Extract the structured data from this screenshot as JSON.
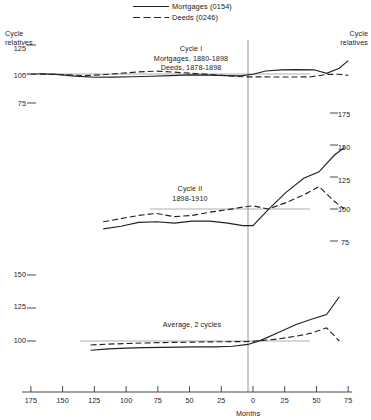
{
  "legend": {
    "position": "top-center",
    "entries": [
      {
        "label": "Mortgages (0154)",
        "style": "solid",
        "color": "#222222"
      },
      {
        "label": "Deeds (0246)",
        "style": "dashed",
        "color": "#222222"
      }
    ]
  },
  "axis_labels": {
    "left_top": "Cycle\nrelatives",
    "right_top": "Cycle\nrelatives",
    "xlabel": "Months"
  },
  "annotations": [
    {
      "name": "cycle-1-annotation",
      "text": "Cycle I\nMortgages, 1880-1898\nDeeds, 1878-1898"
    },
    {
      "name": "cycle-2-annotation",
      "text": "Cycle II\n1898-1910"
    },
    {
      "name": "average-annotation",
      "text": "Average, 2 cycles"
    }
  ],
  "x_axis": {
    "label": "Months",
    "ticks": [
      {
        "value": -175,
        "label": "175"
      },
      {
        "value": -150,
        "label": "150"
      },
      {
        "value": -125,
        "label": "125"
      },
      {
        "value": -100,
        "label": "100"
      },
      {
        "value": -75,
        "label": "75"
      },
      {
        "value": -50,
        "label": "50"
      },
      {
        "value": -25,
        "label": "25"
      },
      {
        "value": 0,
        "label": "0"
      },
      {
        "value": 25,
        "label": "25"
      },
      {
        "value": 50,
        "label": "50"
      },
      {
        "value": 75,
        "label": "75"
      }
    ],
    "range": [
      -182,
      78
    ]
  },
  "panels": [
    {
      "name": "cycle-1-panel",
      "axis_side": "left",
      "tick_labels": [
        "125",
        "100",
        "75"
      ],
      "tick_values": [
        125,
        100,
        75
      ],
      "baseline": 100
    },
    {
      "name": "cycle-2-panel",
      "axis_side": "right",
      "tick_labels": [
        "175",
        "150",
        "125",
        "100",
        "75"
      ],
      "tick_values": [
        175,
        150,
        125,
        100,
        75
      ],
      "baseline": 100
    },
    {
      "name": "average-panel",
      "axis_side": "left",
      "tick_labels": [
        "150",
        "125",
        "100"
      ],
      "tick_values": [
        150,
        125,
        100
      ],
      "baseline": 100
    }
  ],
  "chart_data": {
    "type": "line",
    "title": "",
    "subtitle": "",
    "xlabel": "Months",
    "ylabel": "Cycle relatives",
    "grid": false,
    "legend_position": "top-center",
    "panels": [
      {
        "name": "Cycle I",
        "annotation": "Cycle I / Mortgages, 1880-1898 / Deeds, 1878-1898",
        "ylim": [
          75,
          125
        ],
        "yticks": [
          125,
          100,
          75
        ],
        "xlim": [
          -182,
          78
        ],
        "reference_line": 100,
        "series": [
          {
            "name": "Mortgages (0154)",
            "style": "solid",
            "x": [
              -170,
              -155,
              -140,
              -125,
              -110,
              -95,
              -80,
              -65,
              -50,
              -35,
              -20,
              -10,
              0,
              10,
              22,
              35,
              48,
              58,
              68,
              75
            ],
            "y": [
              100.2,
              99.7,
              98.2,
              97.2,
              97.3,
              97.6,
              98.1,
              98.6,
              99.2,
              99.0,
              98.6,
              98.4,
              99.8,
              102.6,
              103.6,
              103.8,
              103.6,
              100.6,
              105.0,
              111.5
            ]
          },
          {
            "name": "Deeds (0246)",
            "style": "dashed",
            "x": [
              -175,
              -160,
              -146,
              -132,
              -118,
              -104,
              -90,
              -76,
              -62,
              -48,
              -34,
              -20,
              -8,
              4,
              18,
              32,
              46,
              58,
              68,
              75
            ],
            "y": [
              100.0,
              99.8,
              99.2,
              98.6,
              99.4,
              100.6,
              101.8,
              102.5,
              101.6,
              100.6,
              99.6,
              98.4,
              97.6,
              97.5,
              97.4,
              97.4,
              97.6,
              99.6,
              99.8,
              98.8
            ]
          }
        ]
      },
      {
        "name": "Cycle II",
        "annotation": "Cycle II / 1898-1910",
        "ylim": [
          70,
          180
        ],
        "yticks": [
          175,
          150,
          125,
          100,
          75
        ],
        "xlim": [
          -182,
          78
        ],
        "reference_line": 100,
        "series": [
          {
            "name": "Mortgages (0154)",
            "style": "solid",
            "x": [
              -118,
              -104,
              -90,
              -76,
              -62,
              -48,
              -34,
              -20,
              -8,
              0,
              12,
              26,
              40,
              52,
              64,
              72
            ],
            "y": [
              84.5,
              86.5,
              89.5,
              90.0,
              89.0,
              90.5,
              90.5,
              89.0,
              87.0,
              87.0,
              99.5,
              113.0,
              124.0,
              129.0,
              142.0,
              148.0
            ]
          },
          {
            "name": "Deeds (0246)",
            "style": "dashed",
            "x": [
              -118,
              -104,
              -90,
              -76,
              -62,
              -48,
              -34,
              -20,
              -8,
              0,
              12,
              26,
              40,
              52,
              64,
              72
            ],
            "y": [
              90.0,
              92.5,
              95.0,
              96.5,
              94.0,
              95.0,
              97.5,
              99.5,
              101.5,
              102.5,
              100.0,
              105.0,
              111.0,
              117.5,
              106.0,
              100.0
            ]
          }
        ]
      },
      {
        "name": "Average, 2 cycles",
        "annotation": "Average, 2 cycles",
        "ylim": [
          88,
          155
        ],
        "yticks": [
          150,
          125,
          100
        ],
        "xlim": [
          -182,
          78
        ],
        "reference_line": 100,
        "series": [
          {
            "name": "Mortgages (0154)",
            "style": "solid",
            "x": [
              -128,
              -114,
              -100,
              -86,
              -72,
              -58,
              -44,
              -30,
              -16,
              -4,
              6,
              20,
              34,
              46,
              58,
              68
            ],
            "y": [
              93.0,
              94.0,
              94.6,
              95.0,
              95.2,
              95.4,
              95.5,
              95.6,
              96.0,
              97.4,
              100.5,
              106.5,
              112.5,
              116.5,
              120.0,
              133.5
            ]
          },
          {
            "name": "Deeds (0246)",
            "style": "dashed",
            "x": [
              -128,
              -114,
              -100,
              -86,
              -72,
              -58,
              -44,
              -30,
              -16,
              -4,
              6,
              20,
              34,
              46,
              58,
              68
            ],
            "y": [
              97.0,
              97.6,
              98.1,
              98.5,
              98.8,
              99.0,
              99.2,
              99.4,
              99.5,
              99.6,
              100.2,
              101.6,
              103.6,
              106.0,
              110.0,
              100.0
            ]
          }
        ]
      }
    ]
  },
  "colors": {
    "line": "#222222",
    "axis": "#333333",
    "reference": "#888888",
    "text": "#1a1a1a"
  }
}
